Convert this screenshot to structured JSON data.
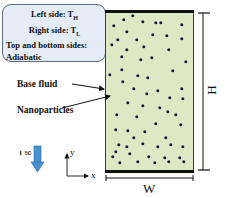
{
  "info_box": {
    "left_side": "Left side: T",
    "left_sub": "H",
    "right_side": "Right side: T",
    "right_sub": "L",
    "top_bottom": "Top and bottom sides:",
    "adiabatic": "Adiabatic"
  },
  "labels": {
    "base_fluid": "Base fluid",
    "nanoparticles": "Nanoparticles",
    "height": "H",
    "width": "W",
    "gravity": "g",
    "axis_x": "x",
    "axis_y": "y"
  },
  "colors": {
    "fluid": "#dde8c4",
    "particle": "#1a1a40",
    "info_bg": "#e4ecf7",
    "gravity_arrow": "#4a90d0"
  },
  "particles": [
    [
      133,
      16
    ],
    [
      124,
      20
    ],
    [
      143,
      22
    ],
    [
      161,
      23
    ],
    [
      156,
      23
    ],
    [
      182,
      25
    ],
    [
      114,
      26
    ],
    [
      127,
      32
    ],
    [
      153,
      35
    ],
    [
      167,
      36
    ],
    [
      118,
      40
    ],
    [
      137,
      40
    ],
    [
      182,
      39
    ],
    [
      112,
      45
    ],
    [
      127,
      50
    ],
    [
      144,
      47
    ],
    [
      169,
      50
    ],
    [
      122,
      57
    ],
    [
      141,
      60
    ],
    [
      152,
      58
    ],
    [
      186,
      62
    ],
    [
      122,
      70
    ],
    [
      138,
      76
    ],
    [
      148,
      78
    ],
    [
      110,
      75
    ],
    [
      173,
      71
    ],
    [
      123,
      82
    ],
    [
      134,
      89
    ],
    [
      158,
      91
    ],
    [
      182,
      89
    ],
    [
      147,
      94
    ],
    [
      170,
      98
    ],
    [
      183,
      99
    ],
    [
      128,
      103
    ],
    [
      160,
      108
    ],
    [
      143,
      106
    ],
    [
      168,
      112
    ],
    [
      176,
      115
    ],
    [
      117,
      115
    ],
    [
      137,
      117
    ],
    [
      156,
      124
    ],
    [
      181,
      125
    ],
    [
      116,
      130
    ],
    [
      128,
      131
    ],
    [
      145,
      132
    ],
    [
      134,
      138
    ],
    [
      166,
      138
    ],
    [
      119,
      145
    ],
    [
      143,
      144
    ],
    [
      158,
      147
    ],
    [
      127,
      147
    ],
    [
      171,
      145
    ],
    [
      183,
      147
    ],
    [
      116,
      152
    ],
    [
      130,
      154
    ],
    [
      180,
      158
    ],
    [
      149,
      157
    ],
    [
      165,
      158
    ],
    [
      120,
      163
    ],
    [
      138,
      162
    ],
    [
      155,
      163
    ],
    [
      169,
      162
    ],
    [
      184,
      162
    ],
    [
      113,
      157
    ]
  ]
}
